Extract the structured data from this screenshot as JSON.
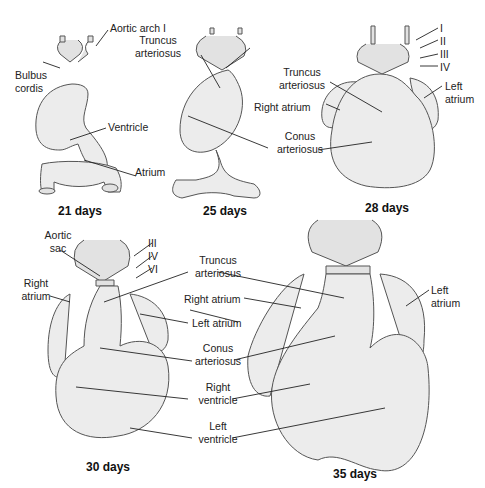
{
  "figure": {
    "panels": [
      {
        "caption": "21 days",
        "labels": {
          "aortic_arch": "Aortic arch I",
          "bulbus": "Bulbus",
          "cordis": "cordis",
          "ventricle": "Ventricle",
          "atrium": "Atrium"
        }
      },
      {
        "caption": "25 days",
        "labels": {
          "truncus1": "Truncus",
          "truncus2": "arteriosus"
        }
      },
      {
        "caption": "28 days",
        "labels": {
          "arch_i": "I",
          "arch_ii": "II",
          "arch_iii": "III",
          "arch_iv": "IV",
          "truncus1": "Truncus",
          "truncus2": "arteriosus",
          "right_atrium": "Right atrium",
          "conus1": "Conus",
          "conus2": "arteriosus",
          "left_atrium1": "Left",
          "left_atrium2": "atrium"
        }
      },
      {
        "caption": "30 days",
        "labels": {
          "aortic_sac1": "Aortic",
          "aortic_sac2": "sac",
          "arch_iii": "III",
          "arch_iv": "IV",
          "arch_vi": "VI",
          "right_atrium1": "Right",
          "right_atrium2": "atrium"
        }
      },
      {
        "caption": "35 days",
        "labels": {
          "truncus1": "Truncus",
          "truncus2": "arteriosus",
          "right_atrium": "Right atrium",
          "left_atrium": "Left atrium",
          "conus1": "Conus",
          "conus2": "arteriosus",
          "right_ventricle1": "Right",
          "right_ventricle2": "ventricle",
          "left_ventricle1": "Left",
          "left_ventricle2": "ventricle",
          "left_atrium_b1": "Left",
          "left_atrium_b2": "atrium"
        }
      }
    ]
  }
}
